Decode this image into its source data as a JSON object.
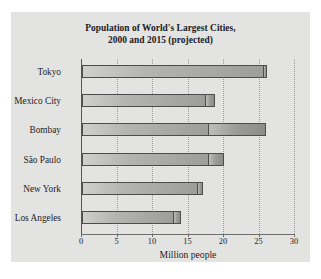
{
  "figure": {
    "background_color": "#e3e3e1",
    "title_line_1": "Population of World's Largest Cities,",
    "title_line_2": "2000 and 2015 (projected)"
  },
  "chart_data": {
    "type": "bar",
    "orientation": "horizontal",
    "stacked": true,
    "title": "Population of World's Largest Cities, 2000 and 2015 (projected)",
    "xlabel": "Million people",
    "ylabel": "",
    "xlim": [
      0,
      30
    ],
    "xticks": [
      0,
      5,
      10,
      15,
      20,
      25,
      30
    ],
    "xtick_labels": [
      "0",
      "5",
      "10",
      "15",
      "20",
      "25",
      "30"
    ],
    "grid": "vertical-dotted",
    "legend": "none",
    "units": "millions of people",
    "categories": [
      "Tokyo",
      "Mexico City",
      "Bombay",
      "São Paulo",
      "New York",
      "Los Angeles"
    ],
    "series": [
      {
        "name": "2000",
        "color": "#b4b4b2",
        "values": [
          25.6,
          17.5,
          17.8,
          17.8,
          16.3,
          13.0
        ]
      },
      {
        "name": "2015 (projected)",
        "color": "#9a9a98",
        "values": [
          26.1,
          18.8,
          25.9,
          20.0,
          17.1,
          13.9
        ]
      }
    ],
    "increments": [
      0.5,
      1.3,
      8.1,
      2.2,
      0.8,
      0.9
    ],
    "bars": [
      {
        "category": "Tokyo",
        "value_2000": 25.6,
        "value_2015": 26.1
      },
      {
        "category": "Mexico City",
        "value_2000": 17.5,
        "value_2015": 18.8
      },
      {
        "category": "Bombay",
        "value_2000": 17.8,
        "value_2015": 25.9
      },
      {
        "category": "São Paulo",
        "value_2000": 17.8,
        "value_2015": 20.0
      },
      {
        "category": "New York",
        "value_2000": 16.3,
        "value_2015": 17.1
      },
      {
        "category": "Los Angeles",
        "value_2000": 13.0,
        "value_2015": 13.9
      }
    ]
  }
}
